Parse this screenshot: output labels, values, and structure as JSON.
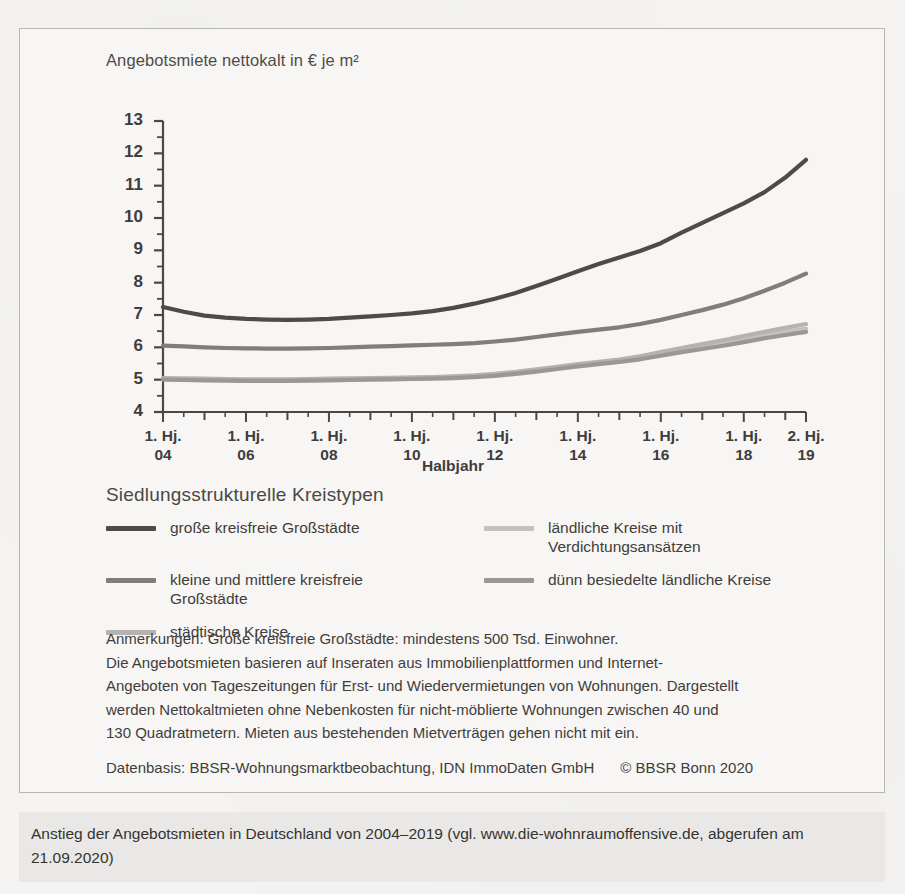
{
  "figure": {
    "y_axis_title": "Angebotsmiete nettokalt in € je m²",
    "x_axis_title": "Halbjahr",
    "legend_title": "Siedlungsstrukturelle Kreistypen"
  },
  "notes": {
    "lines": [
      "Anmerkungen: Große kreisfreie Großstädte: mindestens 500 Tsd. Einwohner.",
      "Die Angebotsmieten basieren auf Inseraten aus Immobilienplattformen und Internet-",
      "Angeboten von Tageszeitungen für Erst- und Wiedervermietungen von Wohnungen. Dargestellt",
      "werden Nettokaltmieten ohne Nebenkosten für nicht-möblierte Wohnungen zwischen 40 und",
      "130 Quadratmetern. Mieten aus bestehenden Mietverträgen gehen nicht mit ein."
    ],
    "data_basis": "Datenbasis: BBSR-Wohnungsmarktbeobachtung, IDN ImmoDaten GmbH",
    "copyright": "© BBSR Bonn 2020"
  },
  "caption": {
    "text": "Anstieg der Angebotsmieten in Deutschland von 2004–2019 (vgl. www.die-wohnraumoffensive.de, abgerufen am 21.09.2020)"
  },
  "chart_data": {
    "type": "line",
    "title": "",
    "xlabel": "Halbjahr",
    "ylabel": "Angebotsmiete nettokalt in € je m²",
    "ylim": [
      4,
      13
    ],
    "ytick_labels": [
      "13",
      "12",
      "11",
      "10",
      "9",
      "8",
      "7",
      "6",
      "5",
      "4"
    ],
    "ytick_values": [
      13,
      12,
      11,
      10,
      9,
      8,
      7,
      6,
      5,
      4
    ],
    "minor_ticks_every": 0.5,
    "grid": false,
    "legend_position": "below",
    "x": [
      "1. Hj. 04",
      "2. Hj. 04",
      "1. Hj. 05",
      "2. Hj. 05",
      "1. Hj. 06",
      "2. Hj. 06",
      "1. Hj. 07",
      "2. Hj. 07",
      "1. Hj. 08",
      "2. Hj. 08",
      "1. Hj. 09",
      "2. Hj. 09",
      "1. Hj. 10",
      "2. Hj. 10",
      "1. Hj. 11",
      "2. Hj. 11",
      "1. Hj. 12",
      "2. Hj. 12",
      "1. Hj. 13",
      "2. Hj. 13",
      "1. Hj. 14",
      "2. Hj. 14",
      "1. Hj. 15",
      "2. Hj. 15",
      "1. Hj. 16",
      "2. Hj. 16",
      "1. Hj. 17",
      "2. Hj. 17",
      "1. Hj. 18",
      "2. Hj. 18",
      "1. Hj. 19",
      "2. Hj. 19"
    ],
    "xtick_labels": [
      {
        "top": "1. Hj.",
        "bottom": "04",
        "index": 0
      },
      {
        "top": "1. Hj.",
        "bottom": "06",
        "index": 4
      },
      {
        "top": "1. Hj.",
        "bottom": "08",
        "index": 8
      },
      {
        "top": "1. Hj.",
        "bottom": "10",
        "index": 12
      },
      {
        "top": "1. Hj.",
        "bottom": "12",
        "index": 16
      },
      {
        "top": "1. Hj.",
        "bottom": "14",
        "index": 20
      },
      {
        "top": "1. Hj.",
        "bottom": "16",
        "index": 24
      },
      {
        "top": "1. Hj.",
        "bottom": "18",
        "index": 28
      },
      {
        "top": "2. Hj.",
        "bottom": "19",
        "index": 31
      }
    ],
    "series": [
      {
        "name": "große kreisfreie Großstädte",
        "color": "#4d4b49",
        "width": 4.2,
        "values": [
          7.25,
          7.1,
          6.98,
          6.92,
          6.88,
          6.86,
          6.85,
          6.86,
          6.88,
          6.92,
          6.96,
          7.0,
          7.05,
          7.12,
          7.22,
          7.35,
          7.5,
          7.68,
          7.9,
          8.12,
          8.35,
          8.58,
          8.78,
          8.98,
          9.22,
          9.55,
          9.85,
          10.15,
          10.45,
          10.8,
          11.25,
          11.8
        ]
      },
      {
        "name": "kleine und mittlere kreisfreie Großstädte",
        "color": "#807d7a",
        "width": 4.2,
        "values": [
          6.05,
          6.03,
          6.0,
          5.98,
          5.97,
          5.96,
          5.96,
          5.97,
          5.98,
          6.0,
          6.02,
          6.04,
          6.06,
          6.08,
          6.1,
          6.13,
          6.18,
          6.24,
          6.32,
          6.4,
          6.48,
          6.55,
          6.62,
          6.72,
          6.85,
          7.0,
          7.15,
          7.32,
          7.52,
          7.75,
          8.0,
          8.28
        ]
      },
      {
        "name": "städtische Kreise",
        "color": "#b5b2af",
        "width": 4.2,
        "values": [
          5.05,
          5.04,
          5.03,
          5.02,
          5.01,
          5.01,
          5.01,
          5.02,
          5.03,
          5.04,
          5.05,
          5.06,
          5.07,
          5.08,
          5.1,
          5.13,
          5.18,
          5.24,
          5.32,
          5.4,
          5.48,
          5.55,
          5.62,
          5.72,
          5.85,
          5.98,
          6.1,
          6.22,
          6.35,
          6.48,
          6.6,
          6.72
        ]
      },
      {
        "name": "ländliche Kreise mit Verdichtungsansätzen",
        "color": "#c4c1be",
        "width": 4.2,
        "values": [
          5.02,
          5.01,
          5.0,
          4.99,
          4.98,
          4.98,
          4.98,
          4.99,
          5.0,
          5.01,
          5.02,
          5.03,
          5.04,
          5.05,
          5.07,
          5.1,
          5.15,
          5.21,
          5.29,
          5.37,
          5.45,
          5.52,
          5.59,
          5.68,
          5.8,
          5.92,
          6.03,
          6.14,
          6.26,
          6.38,
          6.48,
          6.58
        ]
      },
      {
        "name": "dünn besiedelte ländliche Kreise",
        "color": "#9a9794",
        "width": 4.2,
        "values": [
          5.0,
          4.99,
          4.98,
          4.97,
          4.96,
          4.96,
          4.96,
          4.97,
          4.98,
          4.99,
          5.0,
          5.01,
          5.02,
          5.03,
          5.05,
          5.08,
          5.12,
          5.18,
          5.25,
          5.33,
          5.41,
          5.48,
          5.55,
          5.63,
          5.74,
          5.85,
          5.95,
          6.05,
          6.16,
          6.28,
          6.38,
          6.48
        ]
      }
    ],
    "legend_layout": {
      "left_column": [
        0,
        1,
        2
      ],
      "right_column": [
        3,
        4
      ]
    }
  }
}
